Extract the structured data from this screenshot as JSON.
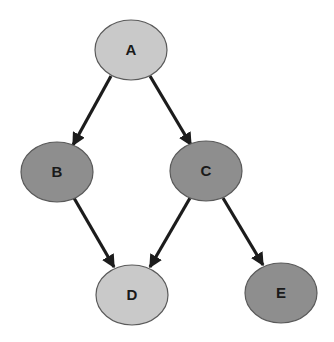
{
  "diagram": {
    "type": "directed-graph",
    "colors": {
      "light_node": "#c9c9c9",
      "dark_node": "#8e8e8e",
      "edge": "#1c1c1c",
      "border": "#5a5a5a"
    },
    "nodes": [
      {
        "id": "A",
        "label": "A",
        "cx": 131,
        "cy": 50,
        "rx": 36,
        "ry": 30,
        "shade": "light"
      },
      {
        "id": "B",
        "label": "B",
        "cx": 57,
        "cy": 172,
        "rx": 36,
        "ry": 30,
        "shade": "dark"
      },
      {
        "id": "C",
        "label": "C",
        "cx": 206,
        "cy": 171,
        "rx": 36,
        "ry": 30,
        "shade": "dark"
      },
      {
        "id": "D",
        "label": "D",
        "cx": 132,
        "cy": 295,
        "rx": 36,
        "ry": 30,
        "shade": "light"
      },
      {
        "id": "E",
        "label": "E",
        "cx": 281,
        "cy": 293,
        "rx": 36,
        "ry": 30,
        "shade": "dark"
      }
    ],
    "edges": [
      {
        "from": "A",
        "to": "B",
        "x1": 111,
        "y1": 76,
        "x2": 73,
        "y2": 145
      },
      {
        "from": "A",
        "to": "C",
        "x1": 150,
        "y1": 76,
        "x2": 191,
        "y2": 145
      },
      {
        "from": "B",
        "to": "D",
        "x1": 74,
        "y1": 198,
        "x2": 114,
        "y2": 267
      },
      {
        "from": "C",
        "to": "D",
        "x1": 190,
        "y1": 198,
        "x2": 150,
        "y2": 267
      },
      {
        "from": "C",
        "to": "E",
        "x1": 223,
        "y1": 198,
        "x2": 263,
        "y2": 265
      }
    ]
  }
}
